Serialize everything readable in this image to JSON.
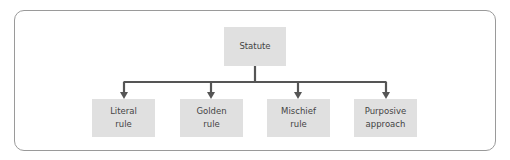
{
  "diagram": {
    "type": "tree",
    "root": {
      "label": "Statute"
    },
    "children": [
      {
        "line1": "Literal",
        "line2": "rule"
      },
      {
        "line1": "Golden",
        "line2": "rule"
      },
      {
        "line1": "Mischief",
        "line2": "rule"
      },
      {
        "line1": "Purposive",
        "line2": "approach"
      }
    ],
    "colors": {
      "box_fill": "#e0e0e0",
      "connector": "#555555",
      "text": "#444444",
      "frame_border": "#9a9a9a"
    }
  }
}
